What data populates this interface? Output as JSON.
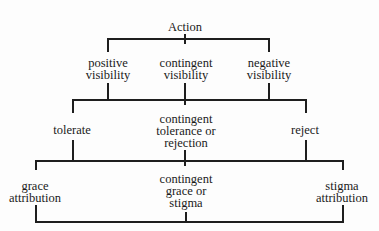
{
  "diagram": {
    "type": "tree",
    "root": {
      "label": "Action"
    },
    "level1": [
      {
        "line1": "positive",
        "line2": "visibility"
      },
      {
        "line1": "contingent",
        "line2": "visibility"
      },
      {
        "line1": "negative",
        "line2": "visibility"
      }
    ],
    "level2": [
      {
        "line1": "tolerate"
      },
      {
        "line1": "contingent",
        "line2": "tolerance or",
        "line3": "rejection"
      },
      {
        "line1": "reject"
      }
    ],
    "level3": [
      {
        "line1": "grace",
        "line2": "attribution"
      },
      {
        "line1": "contingent",
        "line2": "grace or",
        "line3": "stigma"
      },
      {
        "line1": "stigma",
        "line2": "attribution"
      }
    ]
  }
}
